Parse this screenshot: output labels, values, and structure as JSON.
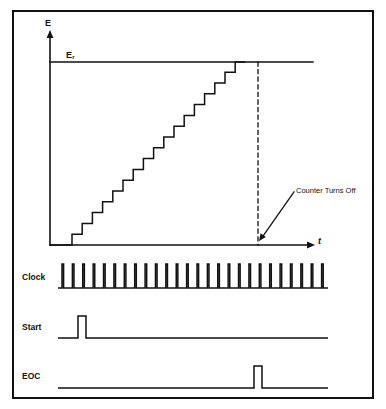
{
  "diagram": {
    "border_color": "#111111",
    "line_color": "#111111",
    "background": "#ffffff"
  },
  "graph": {
    "y_axis_label": "E",
    "x_axis_label": "t",
    "reference_level_label": "E",
    "reference_level_subscript": "r",
    "annotation": "Counter Turns Off",
    "axis": {
      "origin_x": 50,
      "origin_y": 245,
      "y_top": 30,
      "x_right": 313,
      "reference_y": 62
    },
    "staircase": {
      "start_x": 72,
      "baseline_y": 245,
      "step_width": 10.2,
      "step_height": 10.8,
      "steps": 17,
      "top_x": 246
    },
    "dashed_line_x": 258,
    "annotation_arrow": {
      "from_x": 294,
      "from_y": 192,
      "to_x": 259,
      "to_y": 241
    }
  },
  "waveforms": {
    "rows": [
      {
        "label": "Clock",
        "kind": "clock-pulse-train",
        "baseline_y": 288,
        "amplitude": 24,
        "start_x": 58,
        "end_x": 328,
        "pulse_count": 26,
        "pulse_width": 1.6
      },
      {
        "label": "Start",
        "kind": "single-pulse",
        "baseline_y": 338,
        "amplitude": 22,
        "start_x": 58,
        "end_x": 328,
        "pulse_x": 78,
        "pulse_width": 8
      },
      {
        "label": "EOC",
        "kind": "single-pulse",
        "baseline_y": 388,
        "amplitude": 22,
        "start_x": 58,
        "end_x": 328,
        "pulse_x": 254,
        "pulse_width": 8
      }
    ]
  }
}
